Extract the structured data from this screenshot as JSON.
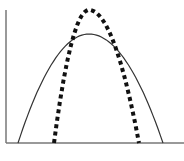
{
  "chart_data": {
    "type": "line",
    "title": "",
    "xlabel": "",
    "ylabel": "",
    "grid": false,
    "legend": null,
    "axes": {
      "y_axis_x": 6,
      "y_axis_top": 10,
      "x_axis_y": 143,
      "x_axis_left": 6,
      "x_axis_right": 184
    },
    "series": [
      {
        "name": "wide-curve",
        "style": "solid",
        "color": "#333333",
        "stroke_width": 1.2,
        "start_x": 18,
        "peak_x": 89,
        "end_x": 163,
        "peak_y": 34
      },
      {
        "name": "narrow-curve",
        "style": "dotted",
        "color": "#111111",
        "stroke_width": 4,
        "start_x": 54,
        "peak_x": 89,
        "end_x": 139,
        "peak_y": 10
      }
    ]
  }
}
